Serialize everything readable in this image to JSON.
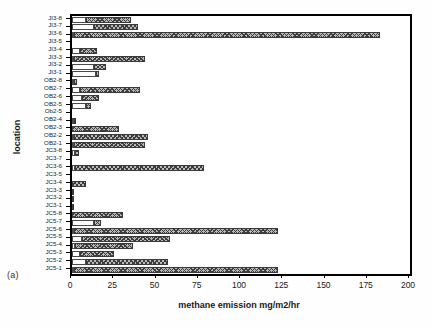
{
  "figure": {
    "panel_label": "(a)",
    "axis_color": "#000000",
    "bar_low_color": "#ffffff",
    "bar_high_color": "#b9b9b9",
    "bar_hatch_color": "#3d3d3d"
  },
  "chart_data": {
    "type": "bar",
    "orientation": "horizontal",
    "title": "",
    "xlabel": "methane emission mg/m2/hr",
    "ylabel": "location",
    "xlim": [
      0,
      200
    ],
    "xticks": [
      0,
      25,
      50,
      75,
      100,
      125,
      150,
      175,
      200
    ],
    "grid": false,
    "legend": "none",
    "categories": [
      "JI3-8",
      "JI3-7",
      "JI3-6",
      "JI3-5",
      "JI3-4",
      "JI3-3",
      "JI3-2",
      "JI3-1",
      "OB2-8",
      "OB2-7",
      "OB2-6",
      "OB2-5",
      "Ob2-5",
      "OB2-4",
      "OB2-3",
      "OB2-2",
      "OB2-1",
      "JC3-8",
      "JC3-7",
      "JC3-6",
      "JC3-5",
      "JC3-4",
      "JC3-3",
      "JC3-2",
      "JC3-1",
      "JC5-8",
      "JC5-7",
      "JC5-6",
      "JC5-5",
      "JC5-4",
      "JC5-3",
      "JC5-2",
      "JC5-1"
    ],
    "series": [
      {
        "name": "low segment",
        "values": [
          8,
          13,
          1,
          0,
          5,
          1,
          13,
          14,
          1,
          5,
          6,
          8,
          0,
          1,
          0,
          1,
          1,
          2,
          0,
          2,
          0,
          0,
          0,
          0,
          0,
          0,
          13,
          1,
          6,
          2,
          5,
          8,
          1
        ]
      },
      {
        "name": "high segment",
        "values": [
          35,
          39,
          182,
          0,
          15,
          43,
          20,
          16,
          3,
          40,
          16,
          11,
          0,
          2,
          28,
          45,
          43,
          4,
          0,
          78,
          0,
          8,
          1,
          1,
          1,
          30,
          17,
          122,
          58,
          36,
          25,
          57,
          122
        ]
      }
    ],
    "bars": [
      {
        "category": "JI3-8",
        "low": 8,
        "high": 35
      },
      {
        "category": "JI3-7",
        "low": 13,
        "high": 39
      },
      {
        "category": "JI3-6",
        "low": 1,
        "high": 182
      },
      {
        "category": "JI3-5",
        "low": 0,
        "high": 0
      },
      {
        "category": "JI3-4",
        "low": 5,
        "high": 15
      },
      {
        "category": "JI3-3",
        "low": 1,
        "high": 43
      },
      {
        "category": "JI3-2",
        "low": 13,
        "high": 20
      },
      {
        "category": "JI3-1",
        "low": 14,
        "high": 16
      },
      {
        "category": "OB2-8",
        "low": 1,
        "high": 3
      },
      {
        "category": "OB2-7",
        "low": 5,
        "high": 40
      },
      {
        "category": "OB2-6",
        "low": 6,
        "high": 16
      },
      {
        "category": "OB2-5",
        "low": 8,
        "high": 11
      },
      {
        "category": "Ob2-5",
        "low": 0,
        "high": 0
      },
      {
        "category": "OB2-4",
        "low": 1,
        "high": 2
      },
      {
        "category": "OB2-3",
        "low": 0,
        "high": 28
      },
      {
        "category": "OB2-2",
        "low": 1,
        "high": 45
      },
      {
        "category": "OB2-1",
        "low": 1,
        "high": 43
      },
      {
        "category": "JC3-8",
        "low": 2,
        "high": 4
      },
      {
        "category": "JC3-7",
        "low": 0,
        "high": 0
      },
      {
        "category": "JC3-6",
        "low": 2,
        "high": 78
      },
      {
        "category": "JC3-5",
        "low": 0,
        "high": 0
      },
      {
        "category": "JC3-4",
        "low": 0,
        "high": 8
      },
      {
        "category": "JC3-3",
        "low": 0,
        "high": 1
      },
      {
        "category": "JC3-2",
        "low": 0,
        "high": 1
      },
      {
        "category": "JC3-1",
        "low": 0,
        "high": 1
      },
      {
        "category": "JC5-8",
        "low": 0,
        "high": 30
      },
      {
        "category": "JC5-7",
        "low": 13,
        "high": 17
      },
      {
        "category": "JC5-6",
        "low": 1,
        "high": 122
      },
      {
        "category": "JC5-5",
        "low": 6,
        "high": 58
      },
      {
        "category": "JC5-4",
        "low": 2,
        "high": 36
      },
      {
        "category": "JC5-3",
        "low": 5,
        "high": 25
      },
      {
        "category": "JC5-2",
        "low": 8,
        "high": 57
      },
      {
        "category": "JC5-1",
        "low": 1,
        "high": 122
      }
    ]
  }
}
